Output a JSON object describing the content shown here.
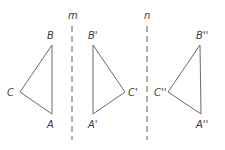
{
  "diagram": {
    "axes": [
      {
        "name": "m",
        "label": "m",
        "x": 72,
        "y1": 26,
        "y2": 140
      },
      {
        "name": "n",
        "label": "n",
        "x": 147,
        "y1": 26,
        "y2": 140
      }
    ],
    "triangles": [
      {
        "name": "ABC",
        "vertices": {
          "A": {
            "label": "A",
            "x": 52,
            "y": 114
          },
          "B": {
            "label": "B",
            "x": 52,
            "y": 45
          },
          "C": {
            "label": "C",
            "x": 20,
            "y": 92
          }
        }
      },
      {
        "name": "A'B'C'",
        "vertices": {
          "A": {
            "label": "A'",
            "x": 93,
            "y": 114
          },
          "B": {
            "label": "B'",
            "x": 93,
            "y": 45
          },
          "C": {
            "label": "C'",
            "x": 125,
            "y": 92
          }
        }
      },
      {
        "name": "A''B''C''",
        "vertices": {
          "A": {
            "label": "A''",
            "x": 201,
            "y": 114
          },
          "B": {
            "label": "B''",
            "x": 200,
            "y": 45
          },
          "C": {
            "label": "C''",
            "x": 168,
            "y": 92
          }
        }
      }
    ],
    "colors": {
      "stroke": "#6a6a6a",
      "text": "#3a3a3a",
      "background": "#ffffff"
    }
  }
}
